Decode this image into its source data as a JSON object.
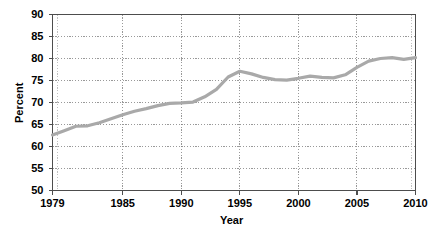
{
  "chart_data": {
    "type": "line",
    "title": "",
    "xlabel": "Year",
    "ylabel": "Percent",
    "xlim": [
      1979,
      2010
    ],
    "ylim": [
      50,
      90
    ],
    "grid": true,
    "legend": "none",
    "line_color": "#a9a9a9",
    "axis_color": "#4d4d4d",
    "grid_color": "#808080",
    "x_ticks": [
      "1979",
      "1985",
      "1990",
      "1995",
      "2000",
      "2005",
      "2010"
    ],
    "x_tick_values": [
      1979,
      1985,
      1990,
      1995,
      2000,
      2005,
      2010
    ],
    "y_ticks": [
      "50",
      "55",
      "60",
      "65",
      "70",
      "75",
      "80",
      "85",
      "90"
    ],
    "y_tick_values": [
      50,
      55,
      60,
      65,
      70,
      75,
      80,
      85,
      90
    ],
    "series": [
      {
        "name": "Percent",
        "x": [
          1979,
          1980,
          1981,
          1982,
          1983,
          1984,
          1985,
          1986,
          1987,
          1988,
          1989,
          1990,
          1991,
          1992,
          1993,
          1994,
          1995,
          1996,
          1997,
          1998,
          1999,
          2000,
          2001,
          2002,
          2003,
          2004,
          2005,
          2006,
          2007,
          2008,
          2009,
          2010
        ],
        "values": [
          62.6,
          63.6,
          64.6,
          64.7,
          65.4,
          66.3,
          67.2,
          68.0,
          68.6,
          69.3,
          69.8,
          69.9,
          70.1,
          71.3,
          73.0,
          75.8,
          77.1,
          76.5,
          75.7,
          75.2,
          75.1,
          75.5,
          76.0,
          75.7,
          75.6,
          76.3,
          78.0,
          79.4,
          80.0,
          80.2,
          79.8,
          80.2
        ]
      }
    ]
  },
  "axis_titles": {
    "x": "Year",
    "y": "Percent"
  }
}
